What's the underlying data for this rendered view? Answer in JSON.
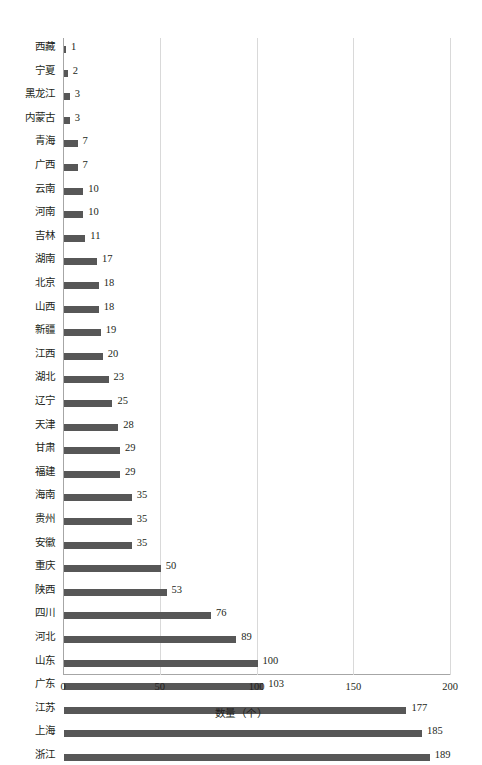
{
  "chart_data": {
    "type": "bar",
    "orientation": "horizontal",
    "title": "",
    "xlabel": "数量（个）",
    "ylabel": "",
    "xlim": [
      0,
      200
    ],
    "xticks": [
      0,
      50,
      100,
      150,
      200
    ],
    "grid": true,
    "legend": null,
    "bar_color": "#575757",
    "grid_color": "#d9d9d9",
    "axis_color": "#a6a6a6",
    "categories": [
      "西藏",
      "宁夏",
      "黑龙江",
      "内蒙古",
      "青海",
      "广西",
      "云南",
      "河南",
      "吉林",
      "湖南",
      "北京",
      "山西",
      "新疆",
      "江西",
      "湖北",
      "辽宁",
      "天津",
      "甘肃",
      "福建",
      "海南",
      "贵州",
      "安徽",
      "重庆",
      "陕西",
      "四川",
      "河北",
      "山东",
      "广东",
      "江苏",
      "上海",
      "浙江"
    ],
    "values": [
      1,
      2,
      3,
      3,
      7,
      7,
      10,
      10,
      11,
      17,
      18,
      18,
      19,
      20,
      23,
      25,
      28,
      29,
      29,
      35,
      35,
      35,
      50,
      53,
      76,
      89,
      100,
      103,
      177,
      185,
      189
    ],
    "value_labels": [
      "1",
      "2",
      "3",
      "3",
      "7",
      "7",
      "10",
      "10",
      "11",
      "17",
      "18",
      "18",
      "19",
      "20",
      "23",
      "25",
      "28",
      "29",
      "29",
      "35",
      "35",
      "35",
      "50",
      "53",
      "76",
      "89",
      "100",
      "103",
      "177",
      "185",
      "189"
    ]
  }
}
